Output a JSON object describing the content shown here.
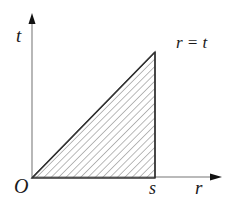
{
  "diagram": {
    "type": "region-plot",
    "axes": {
      "horizontal_label": "r",
      "vertical_label": "t",
      "origin_label": "O"
    },
    "boundary_line_label": "r = t",
    "tick_labels": {
      "r_bound": "s"
    },
    "region": {
      "description": "Triangle bounded by t = 0, r = s, and r = t, hatched",
      "vertices": [
        [
          "0",
          "0"
        ],
        [
          "s",
          "s"
        ],
        [
          "s",
          "0"
        ]
      ],
      "fill": "diagonal-hatch"
    },
    "colors": {
      "axis": "#777777",
      "outline": "#333333",
      "hatch": "#555555",
      "text": "#1a1a1a",
      "background": "#ffffff"
    }
  }
}
